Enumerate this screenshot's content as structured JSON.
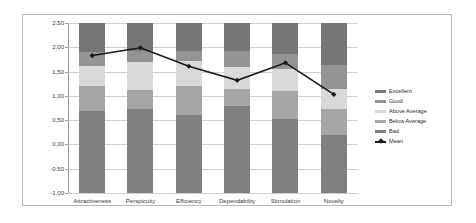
{
  "chart_data": {
    "type": "bar",
    "title": "",
    "xlabel": "",
    "ylabel": "",
    "ylim": [
      -1.0,
      2.5
    ],
    "ytick_labels": [
      "2,50",
      "2,00",
      "1,50",
      "1,00",
      "0,50",
      "0,00",
      "-0,50",
      "-1,00"
    ],
    "ytick_values": [
      2.5,
      2.0,
      1.5,
      1.0,
      0.5,
      0.0,
      -0.5,
      -1.0
    ],
    "grid": true,
    "legend_position": "right",
    "stacked": true,
    "categories": [
      "Attractiveness",
      "Perspicuity",
      "Efficiency",
      "Dependability",
      "Stimulation",
      "Novelty"
    ],
    "series": [
      {
        "name": "Bad",
        "color": "#808080",
        "tops": [
          0.68,
          0.72,
          0.61,
          0.8,
          0.52,
          0.2
        ]
      },
      {
        "name": "Below Average",
        "color": "#a6a6a6",
        "tops": [
          1.2,
          1.12,
          1.2,
          1.15,
          1.1,
          0.73
        ]
      },
      {
        "name": "Above Average",
        "color": "#d9d9d9",
        "tops": [
          1.62,
          1.7,
          1.71,
          1.6,
          1.55,
          1.15
        ]
      },
      {
        "name": "Good",
        "color": "#949494",
        "tops": [
          1.91,
          1.93,
          1.92,
          1.93,
          1.87,
          1.64
        ]
      },
      {
        "name": "Excellent",
        "color": "#767676",
        "tops": [
          2.5,
          2.5,
          2.5,
          2.5,
          2.5,
          2.5
        ]
      }
    ],
    "mean": {
      "name": "Mean",
      "color": "#1a1a1a",
      "values": [
        1.83,
        1.99,
        1.61,
        1.32,
        1.68,
        1.03
      ]
    },
    "legend": [
      {
        "label": "Excellent",
        "color": "#767676",
        "type": "swatch"
      },
      {
        "label": "Good",
        "color": "#949494",
        "type": "swatch"
      },
      {
        "label": "Above Average",
        "color": "#d9d9d9",
        "type": "swatch"
      },
      {
        "label": "Below Average",
        "color": "#a6a6a6",
        "type": "swatch"
      },
      {
        "label": "Bad",
        "color": "#808080",
        "type": "swatch"
      },
      {
        "label": "Mean",
        "color": "#1a1a1a",
        "type": "line-marker"
      }
    ]
  }
}
